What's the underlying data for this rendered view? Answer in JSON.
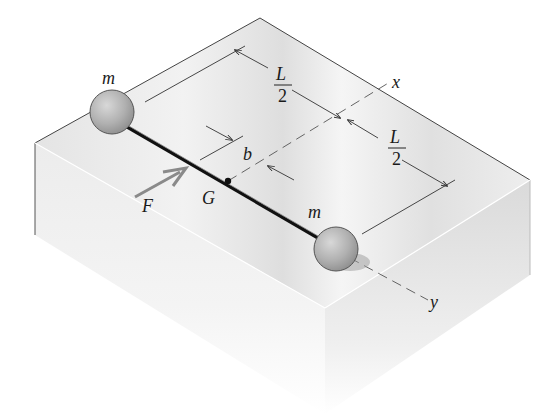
{
  "figure": {
    "labels": {
      "mass_top": "m",
      "mass_bottom": "m",
      "force": "F",
      "center": "G",
      "offset": "b",
      "half_length_num_1": "L",
      "half_length_den_1": "2",
      "half_length_num_2": "L",
      "half_length_den_2": "2",
      "axis_x": "x",
      "axis_y": "y"
    },
    "colors": {
      "block_top": "#e9e9e9",
      "block_left": "#f0f0f0",
      "block_right": "#dcdcdc",
      "edge": "#444444",
      "sphere": "#b5b5b5",
      "rod": "#222222",
      "force_arrow": "#8a8a8a",
      "dim_line": "#333333"
    }
  }
}
